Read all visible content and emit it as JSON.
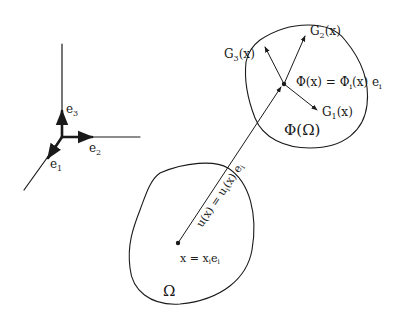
{
  "basis": {
    "e1": "e",
    "e1_sub": "1",
    "e2": "e",
    "e2_sub": "2",
    "e3": "e",
    "e3_sub": "3"
  },
  "regions": {
    "reference": "Ω",
    "deformed": "Φ(Ω)"
  },
  "point": {
    "label": "x = x",
    "label_sub": "i",
    "label_tail": "e",
    "label_tail_sub": "i"
  },
  "displacement": {
    "label": "u(x) = u",
    "label_sub": "i",
    "label_tail": "(x) e",
    "label_tail_sub": "i"
  },
  "mapped_point": {
    "label": "Φ(x) = Φ",
    "label_sub": "i",
    "label_tail": "(x) e",
    "label_tail_sub": "i"
  },
  "gradients": {
    "g1": "G",
    "g1_sub": "1",
    "g1_tail": "(x)",
    "g2": "G",
    "g2_sub": "2",
    "g2_tail": "(x)",
    "g3": "G",
    "g3_sub": "3",
    "g3_tail": "(x)"
  }
}
